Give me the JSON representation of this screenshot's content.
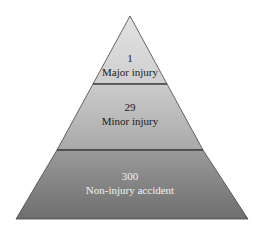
{
  "diagram": {
    "type": "pyramid",
    "levels": [
      {
        "count": "1",
        "label": "Major injury",
        "color_top": "#e2e2e2",
        "color_bottom": "#cfcfcf",
        "text_color": "dark"
      },
      {
        "count": "29",
        "label": "Minor injury",
        "color_top": "#cbcbcb",
        "color_bottom": "#a9a9a9",
        "text_color": "dark"
      },
      {
        "count": "300",
        "label": "Non-injury accident",
        "color_top": "#9a9a9a",
        "color_bottom": "#6e6e6e",
        "text_color": "light"
      }
    ]
  }
}
